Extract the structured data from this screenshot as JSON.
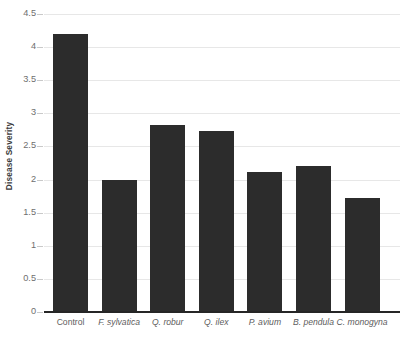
{
  "chart_data": {
    "type": "bar",
    "title": "",
    "subtitle": "",
    "xlabel": "",
    "ylabel": "Disease Severity",
    "categories": [
      "Control",
      "F. sylvatica",
      "Q. robur",
      "Q. ilex",
      "P. avium",
      "B. pendula",
      "C. monogyna"
    ],
    "values": [
      4.2,
      2.0,
      2.83,
      2.73,
      2.11,
      2.2,
      1.72
    ],
    "ylim": [
      0,
      4.5
    ],
    "ytick_labels": [
      "4.5",
      "4",
      "3.5",
      "3",
      "2.5",
      "2",
      "1.5",
      "1",
      "0.5",
      "0"
    ],
    "ytick_values": [
      4.5,
      4,
      3.5,
      3,
      2.5,
      2,
      1.5,
      1,
      0.5,
      0
    ],
    "grid": true,
    "legend": false,
    "legend_position": "none",
    "bar_color": "#2c2c2c",
    "gridline_color": "#e7e7e7",
    "axis_color": "#262626",
    "tick_label_color": "#6e6e6e",
    "category_styles": [
      "normal",
      "italic",
      "italic",
      "italic",
      "italic",
      "italic",
      "italic"
    ]
  }
}
